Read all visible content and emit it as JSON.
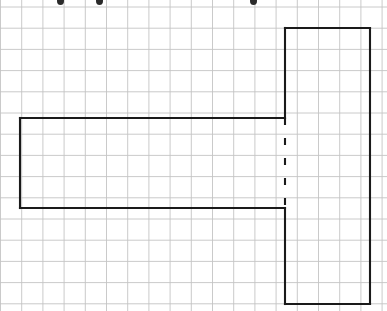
{
  "canvas": {
    "width": 387,
    "height": 311,
    "background_color": "#ffffff"
  },
  "grid": {
    "name": "square-grid-paper",
    "cell_size": 21.2,
    "line_color": "#c4c4c4",
    "line_width": 0.9,
    "origin_x": 0.5,
    "origin_y": 7.0,
    "columns": 19,
    "rows": 15,
    "visible": true
  },
  "figure": {
    "name": "composite-rectilinear-shape",
    "stroke_color": "#1a1a1a",
    "stroke_width": 2.1,
    "dash_color": "#1a1a1a",
    "dash_pattern": "7,13",
    "parts": [
      {
        "name": "horizontal-rectangle-left",
        "x1": 20,
        "y1": 118,
        "x2": 285,
        "y2": 208,
        "width_cells": 12.5,
        "height_cells": 4.25
      },
      {
        "name": "vertical-rectangle-right",
        "x1": 285,
        "y1": 28,
        "x2": 370,
        "y2": 304,
        "width_cells": 4,
        "height_cells": 13
      }
    ],
    "solid_segments": [
      {
        "name": "left-part-top-edge",
        "x1": 20,
        "y1": 118,
        "x2": 285,
        "y2": 118
      },
      {
        "name": "left-part-left-edge",
        "x1": 20,
        "y1": 118,
        "x2": 20,
        "y2": 208
      },
      {
        "name": "left-part-bottom-edge",
        "x1": 20,
        "y1": 208,
        "x2": 285,
        "y2": 208
      },
      {
        "name": "right-part-upper-left-edge",
        "x1": 285,
        "y1": 28,
        "x2": 285,
        "y2": 118
      },
      {
        "name": "right-part-top-edge",
        "x1": 285,
        "y1": 28,
        "x2": 370,
        "y2": 28
      },
      {
        "name": "right-part-right-edge",
        "x1": 370,
        "y1": 28,
        "x2": 370,
        "y2": 304
      },
      {
        "name": "right-part-bottom-edge",
        "x1": 285,
        "y1": 304,
        "x2": 370,
        "y2": 304
      },
      {
        "name": "right-part-lower-left-edge",
        "x1": 285,
        "y1": 208,
        "x2": 285,
        "y2": 304
      }
    ],
    "dashed_segments": [
      {
        "name": "internal-shared-boundary",
        "x1": 285,
        "y1": 118,
        "x2": 285,
        "y2": 208
      }
    ]
  },
  "artifacts": {
    "name": "cropped-text-descenders",
    "description": "Partial dark marks at the very top edge of the crop, descenders of letters from a line of text above the visible area.",
    "color": "#2a2a2a",
    "marks": [
      {
        "name": "descender-mark-1",
        "x": 57,
        "y": 0,
        "w": 7,
        "h": 5
      },
      {
        "name": "descender-mark-2",
        "x": 96,
        "y": 0,
        "w": 7,
        "h": 5
      },
      {
        "name": "descender-mark-3",
        "x": 250,
        "y": 0,
        "w": 7,
        "h": 5
      }
    ]
  }
}
